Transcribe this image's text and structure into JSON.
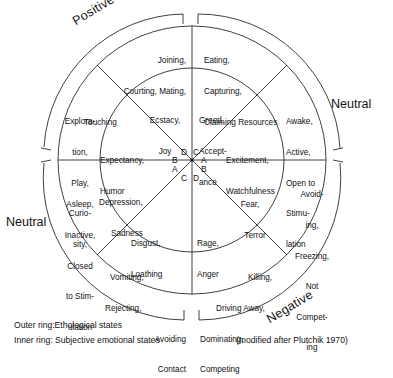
{
  "figure": {
    "type": "diagram",
    "subtype": "emotion-wheel",
    "attribution": "(modified after Plutchik 1970)",
    "legend": {
      "outer": "Outer ring:Ethological states",
      "inner": "Inner ring: Subjective emotional states"
    }
  },
  "axis_labels": [
    {
      "id": "positive",
      "text": "Positive",
      "position": "upper-left-arc",
      "rotated": true
    },
    {
      "id": "neutral_right",
      "text": "Neutral",
      "position": "upper-right",
      "rotated": false
    },
    {
      "id": "neutral_left",
      "text": "Neutral",
      "position": "lower-left",
      "rotated": false
    },
    {
      "id": "negative",
      "text": "Negative",
      "position": "lower-right-arc",
      "rotated": true
    }
  ],
  "outer_ring": {
    "title": "Ethological states",
    "sectors": [
      {
        "id": "outer-n-ne",
        "lines": [
          "Eating,",
          "Capturing,",
          "Claiming Resources"
        ]
      },
      {
        "id": "outer-ne",
        "lines": [
          "Awake,",
          "Active,",
          "Open to",
          "Stimu-",
          "lation"
        ]
      },
      {
        "id": "outer-se",
        "lines": [
          "Avoid-",
          "ing,",
          "Freezing,",
          "Not",
          "Compet-",
          "ing"
        ]
      },
      {
        "id": "outer-s-se",
        "lines": [
          "Killing,",
          "Driving Away,",
          "Dominating,",
          "Competing"
        ]
      },
      {
        "id": "outer-s-sw",
        "lines": [
          "Vomiting,",
          "Rejecting,",
          "Avoiding",
          "Contact"
        ]
      },
      {
        "id": "outer-sw",
        "lines": [
          "Asleep,",
          "Inactive,",
          "Closed",
          "to Stim-",
          "ulation"
        ]
      },
      {
        "id": "outer-nw",
        "lines": [
          "Explora-",
          "tion,",
          "Play,",
          "Curio-",
          "sity,"
        ]
      },
      {
        "id": "outer-n-nw",
        "lines": [
          "Joining,",
          "Courting, Mating,",
          "Touching"
        ]
      }
    ]
  },
  "inner_ring": {
    "title": "Subjective emotional states",
    "sectors": [
      {
        "id": "inner-n-ne",
        "lines": [
          "Greed,",
          "Accept-",
          "ance"
        ]
      },
      {
        "id": "inner-ne",
        "lines": [
          "Excitement,",
          "Watchfulness"
        ]
      },
      {
        "id": "inner-se",
        "lines": [
          "Fear,",
          "Terror"
        ]
      },
      {
        "id": "inner-s-se",
        "lines": [
          "Rage,",
          "Anger"
        ]
      },
      {
        "id": "inner-s-sw",
        "lines": [
          "Disgust,",
          "Loathing"
        ]
      },
      {
        "id": "inner-sw",
        "lines": [
          "Depression,",
          "Sadness"
        ]
      },
      {
        "id": "inner-nw",
        "lines": [
          "Expectancy,",
          "Humor"
        ]
      },
      {
        "id": "inner-n-nw",
        "lines": [
          "Ecstacy,",
          "Joy"
        ]
      }
    ]
  },
  "center_letters": [
    {
      "id": "letter-d-upper-left",
      "text": "D"
    },
    {
      "id": "letter-c-upper-right",
      "text": "C"
    },
    {
      "id": "letter-b-left-upper",
      "text": "B"
    },
    {
      "id": "letter-a-right-upper",
      "text": "A"
    },
    {
      "id": "letter-a-left-lower",
      "text": "A"
    },
    {
      "id": "letter-b-right-lower",
      "text": "B"
    },
    {
      "id": "letter-c-lower-left",
      "text": "C"
    },
    {
      "id": "letter-d-lower-right",
      "text": "D"
    }
  ],
  "colors": {
    "ink": "#1a1a1a",
    "background": "#ffffff"
  }
}
